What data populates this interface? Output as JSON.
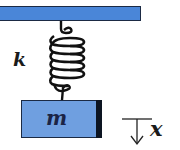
{
  "diagram": {
    "labels": {
      "spring_constant": "k",
      "mass": "m",
      "displacement": "x"
    },
    "colors": {
      "ceiling": "#4a86d8",
      "block": "#6f9fe0",
      "outline": "#1b2a44",
      "spring": "#111111"
    },
    "displacement_direction": "down"
  }
}
